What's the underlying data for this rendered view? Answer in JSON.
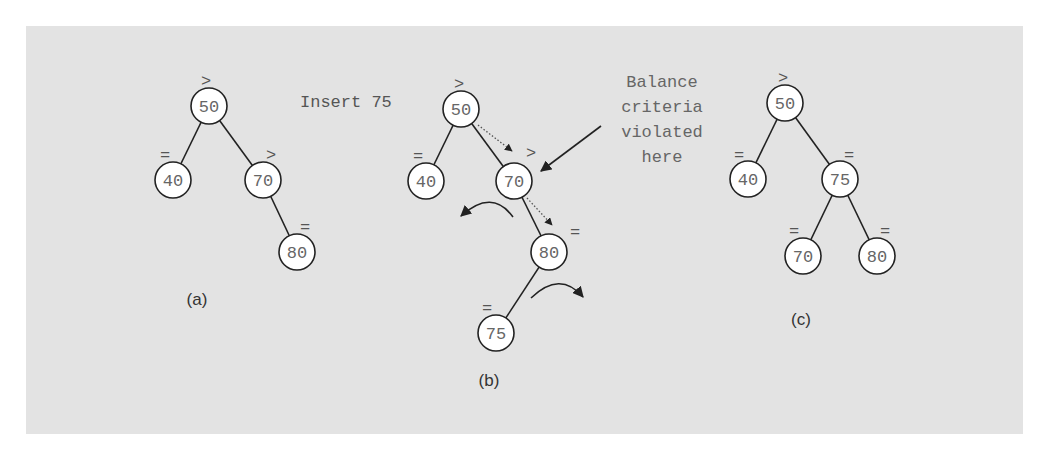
{
  "diagram": {
    "colors": {
      "panel_background": "#e3e3e3",
      "node_fill": "#ffffff",
      "node_stroke": "#222222",
      "node_text": "#666666"
    },
    "trees": [
      {
        "id": "a",
        "caption": "(a)",
        "nodes": [
          {
            "value": "50",
            "balance": ">"
          },
          {
            "value": "40",
            "balance": "="
          },
          {
            "value": "70",
            "balance": ">"
          },
          {
            "value": "80",
            "balance": "="
          }
        ]
      },
      {
        "id": "b",
        "caption": "(b)",
        "operation_label": "Insert 75",
        "nodes": [
          {
            "value": "50",
            "balance": ">"
          },
          {
            "value": "40",
            "balance": "="
          },
          {
            "value": "70",
            "balance": ">"
          },
          {
            "value": "80",
            "balance": "="
          },
          {
            "value": "75",
            "balance": "="
          }
        ],
        "annotation": {
          "lines": [
            "Balance",
            "criteria",
            "violated",
            "here"
          ]
        }
      },
      {
        "id": "c",
        "caption": "(c)",
        "nodes": [
          {
            "value": "50",
            "balance": ">"
          },
          {
            "value": "40",
            "balance": "="
          },
          {
            "value": "75",
            "balance": "="
          },
          {
            "value": "70",
            "balance": "="
          },
          {
            "value": "80",
            "balance": "="
          }
        ]
      }
    ]
  }
}
